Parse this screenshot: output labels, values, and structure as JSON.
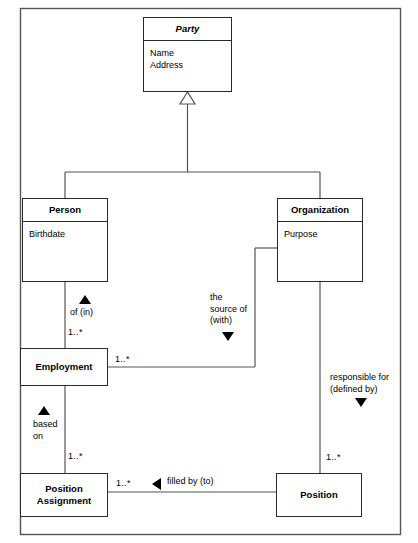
{
  "diagram": {
    "type": "uml-class-diagram",
    "frame": {
      "x": 20,
      "y": 8,
      "width": 381,
      "height": 527,
      "border_color": "#555555"
    },
    "line_color": "#2a2a2a",
    "background": "#ffffff"
  },
  "classes": [
    {
      "id": "party",
      "name": "Party",
      "abstract": true,
      "attributes": [
        "Name",
        "Address"
      ],
      "x": 143,
      "y": 17,
      "width": 89,
      "height": 75
    },
    {
      "id": "person",
      "name": "Person",
      "abstract": false,
      "attributes": [
        "Birthdate"
      ],
      "x": 22,
      "y": 198,
      "width": 86,
      "height": 84
    },
    {
      "id": "organization",
      "name": "Organization",
      "abstract": false,
      "attributes": [
        "Purpose"
      ],
      "x": 277,
      "y": 198,
      "width": 86,
      "height": 84
    },
    {
      "id": "employment",
      "name": "Employment",
      "abstract": false,
      "attributes": [],
      "x": 20,
      "y": 348,
      "width": 88,
      "height": 38
    },
    {
      "id": "position-assignment",
      "name": "Position Assignment",
      "abstract": false,
      "attributes": [],
      "x": 20,
      "y": 473,
      "width": 88,
      "height": 44
    },
    {
      "id": "position",
      "name": "Position",
      "abstract": false,
      "attributes": [],
      "x": 276,
      "y": 473,
      "width": 86,
      "height": 44
    }
  ],
  "relationships": [
    {
      "id": "generalization-party",
      "kind": "generalization",
      "from": [
        "person",
        "organization"
      ],
      "to": "party",
      "marker": "hollow-triangle"
    },
    {
      "id": "person-employment",
      "kind": "association",
      "from": "person",
      "to": "employment",
      "label": "of (in)",
      "marker": "solid-triangle-up",
      "multiplicity": "1..*"
    },
    {
      "id": "organization-employment",
      "kind": "association",
      "from": "organization",
      "to": "employment",
      "label": "the source of (with)",
      "marker": "solid-triangle-down",
      "multiplicity": "1..*"
    },
    {
      "id": "employment-position-assignment",
      "kind": "association",
      "from": "employment",
      "to": "position-assignment",
      "label": "based on",
      "marker": "solid-triangle-up",
      "multiplicity": "1..*"
    },
    {
      "id": "organization-position",
      "kind": "association",
      "from": "organization",
      "to": "position",
      "label": "responsible for (defined by)",
      "marker": "solid-triangle-down",
      "multiplicity": "1..*"
    },
    {
      "id": "position-position-assignment",
      "kind": "association",
      "from": "position",
      "to": "position-assignment",
      "label": "filled by (to)",
      "marker": "solid-triangle-left",
      "multiplicity": "1..*"
    }
  ],
  "labels": {
    "of_in": {
      "text": "of (in)",
      "x": 66,
      "y": 308
    },
    "the_source_of": {
      "line1": "the",
      "line2": "source of",
      "line3": "(with)",
      "x": 210,
      "y": 294
    },
    "responsible_for": {
      "line1": "responsible for",
      "line2": "(defined by)",
      "x": 330,
      "y": 374
    },
    "based_on": {
      "line1": "based",
      "line2": "on",
      "x": 36,
      "y": 422
    },
    "filled_by": {
      "text": "filled by (to)",
      "x": 162,
      "y": 477
    }
  },
  "multiplicities": {
    "person_employment": {
      "text": "1..*",
      "x": 67,
      "y": 328
    },
    "employment_org": {
      "text": "1..*",
      "x": 116,
      "y": 355
    },
    "employment_posassign": {
      "text": "1..*",
      "x": 67,
      "y": 452
    },
    "posassign_position": {
      "text": "1..*",
      "x": 117,
      "y": 478
    },
    "position_org": {
      "text": "1..*",
      "x": 327,
      "y": 453
    }
  }
}
